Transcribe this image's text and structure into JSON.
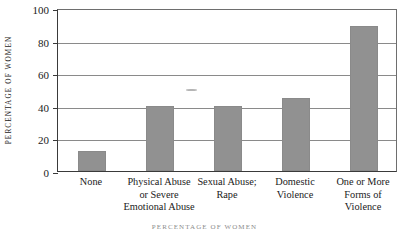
{
  "chart_data": {
    "type": "bar",
    "title": "",
    "xlabel": "",
    "ylabel": "PERCENTAGE OF WOMEN",
    "ylim": [
      0,
      100
    ],
    "yticks": [
      0,
      20,
      40,
      60,
      80,
      100
    ],
    "ytick_labels": [
      "0",
      "20",
      "40",
      "60",
      "80",
      "100"
    ],
    "grid": true,
    "legend": false,
    "categories": [
      "None",
      "Physical Abuse or Severe Emotional Abuse",
      "Sexual Abuse; Rape",
      "Domestic Violence",
      "One or More Forms of Violence"
    ],
    "category_label_lines": [
      [
        "None"
      ],
      [
        "Physical Abuse",
        "or Severe",
        "Emotional Abuse"
      ],
      [
        "Sexual Abuse;",
        "Rape"
      ],
      [
        "Domestic",
        "Violence"
      ],
      [
        "One or More",
        "Forms of",
        "Violence"
      ]
    ],
    "values": [
      12,
      40,
      40,
      45,
      89
    ],
    "bar_color": "#919191"
  },
  "axis": {
    "ylabel": "PERCENTAGE OF WOMEN"
  },
  "footer": {
    "caption": "PERCENTAGE OF WOMEN"
  }
}
